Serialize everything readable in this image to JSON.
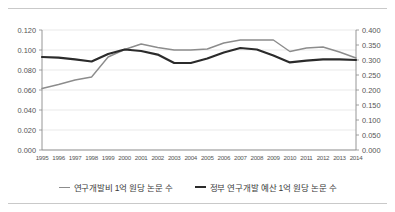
{
  "chart_data": {
    "type": "line",
    "title": "",
    "xlabel": "",
    "ylabel": "",
    "grid": true,
    "legend_position": "bottom",
    "categories": [
      "1995",
      "1996",
      "1997",
      "1998",
      "1999",
      "2000",
      "2001",
      "2002",
      "2003",
      "2004",
      "2005",
      "2006",
      "2007",
      "2008",
      "2009",
      "2010",
      "2011",
      "2012",
      "2013",
      "2014"
    ],
    "left_axis": {
      "ylim": [
        0.0,
        0.12
      ],
      "tick_step": 0.02,
      "tick_labels": [
        "0.000",
        "0.020",
        "0.040",
        "0.060",
        "0.080",
        "0.100",
        "0.120"
      ],
      "tick_values": [
        0.0,
        0.02,
        0.04,
        0.06,
        0.08,
        0.1,
        0.12
      ]
    },
    "right_axis": {
      "ylim": [
        0.0,
        0.4
      ],
      "tick_step": 0.05,
      "tick_labels": [
        "0.000",
        "0.050",
        "0.100",
        "0.150",
        "0.200",
        "0.250",
        "0.300",
        "0.350",
        "0.400"
      ],
      "tick_values": [
        0.0,
        0.05,
        0.1,
        0.15,
        0.2,
        0.25,
        0.3,
        0.35,
        0.4
      ]
    },
    "series": [
      {
        "name": "연구개발비 1억 원당 논문 수",
        "axis": "left",
        "color": "#8c8c8c",
        "width": 1.4,
        "values": [
          0.0615,
          0.0655,
          0.07,
          0.073,
          0.093,
          0.1005,
          0.106,
          0.1025,
          0.1,
          0.1,
          0.101,
          0.107,
          0.11,
          0.11,
          0.11,
          0.0985,
          0.102,
          0.103,
          0.098,
          0.092
        ]
      },
      {
        "name": "정부 연구개발 예산 1억 원당 논문 수",
        "axis": "right",
        "color": "#2b2b2b",
        "width": 2.2,
        "values": [
          0.31,
          0.308,
          0.302,
          0.295,
          0.32,
          0.335,
          0.33,
          0.318,
          0.29,
          0.29,
          0.305,
          0.325,
          0.34,
          0.335,
          0.315,
          0.292,
          0.298,
          0.302,
          0.302,
          0.3
        ]
      }
    ]
  },
  "legend": {
    "items": [
      {
        "label": "연구개발비 1억 원당 논문 수"
      },
      {
        "label": "정부 연구개발 예산 1억 원당 논문 수"
      }
    ]
  }
}
